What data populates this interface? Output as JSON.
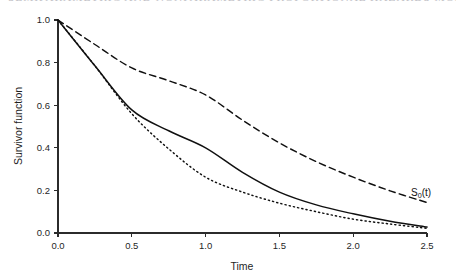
{
  "page_header_fragment": {
    "text": "SEMIPARAMETRIC AND NONPARAMETRIC PROPORTIONAL HAZARDS MODELS"
  },
  "chart_data": {
    "type": "line",
    "title": "",
    "xlabel": "Time",
    "ylabel": "Survivor function",
    "xlim": [
      0.0,
      2.5
    ],
    "ylim": [
      0.0,
      1.0
    ],
    "grid": false,
    "legend_position": "inline-right",
    "xticks": [
      "0.0",
      "0.5",
      "1.0",
      "1.5",
      "2.0",
      "2.5"
    ],
    "xtick_values": [
      0.0,
      0.5,
      1.0,
      1.5,
      2.0,
      2.5
    ],
    "yticks": [
      "0.0",
      "0.2",
      "0.4",
      "0.6",
      "0.8",
      "1.0"
    ],
    "ytick_values": [
      0.0,
      0.2,
      0.4,
      0.6,
      0.8,
      1.0
    ],
    "x": [
      0.0,
      0.25,
      0.5,
      0.75,
      1.0,
      1.25,
      1.5,
      1.75,
      2.0,
      2.25,
      2.5
    ],
    "series": [
      {
        "name": "S0(t)",
        "label": "S₀(t)",
        "style": "dashed",
        "color": "#101010",
        "annotation": {
          "text_main": "S",
          "text_sub": "0",
          "text_tail": "(t)",
          "at_x": 2.48,
          "at_y": 0.175
        },
        "values": [
          1.0,
          0.885,
          0.775,
          0.715,
          0.648,
          0.53,
          0.423,
          0.335,
          0.262,
          0.198,
          0.143
        ]
      },
      {
        "name": "solid-curve",
        "label": "",
        "style": "solid",
        "color": "#101010",
        "values": [
          1.0,
          0.785,
          0.578,
          0.48,
          0.4,
          0.285,
          0.192,
          0.132,
          0.09,
          0.055,
          0.028
        ]
      },
      {
        "name": "dotted-curve",
        "label": "",
        "style": "dotted",
        "color": "#101010",
        "values": [
          1.0,
          0.785,
          0.56,
          0.395,
          0.262,
          0.192,
          0.14,
          0.1,
          0.065,
          0.042,
          0.022
        ]
      }
    ]
  }
}
